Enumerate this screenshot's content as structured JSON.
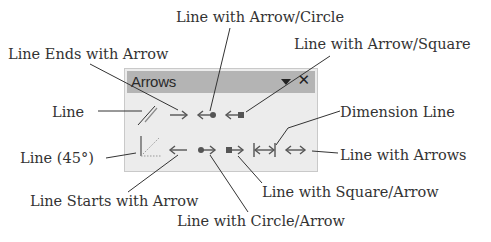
{
  "panel": {
    "title": "Arrows",
    "menu_icon": "dropdown-triangle-icon",
    "close_icon": "close-icon"
  },
  "tools": {
    "row1": [
      {
        "name": "line",
        "label": "Line"
      },
      {
        "name": "line-ends-with-arrow",
        "label": "Line Ends with Arrow"
      },
      {
        "name": "line-with-arrow-circle",
        "label": "Line with Arrow/Circle"
      },
      {
        "name": "line-with-arrow-square",
        "label": "Line with Arrow/Square"
      }
    ],
    "row2": [
      {
        "name": "line-45",
        "label": "Line (45°)"
      },
      {
        "name": "line-starts-with-arrow",
        "label": "Line Starts with Arrow"
      },
      {
        "name": "line-with-circle-arrow",
        "label": "Line with Circle/Arrow"
      },
      {
        "name": "line-with-square-arrow",
        "label": "Line with Square/Arrow"
      },
      {
        "name": "dimension-line",
        "label": "Dimension Line"
      },
      {
        "name": "line-with-arrows",
        "label": "Line with Arrows"
      }
    ]
  },
  "callouts": {
    "line_ends_with_arrow": "Line Ends with Arrow",
    "line_with_arrow_circle": "Line with Arrow/Circle",
    "line_with_arrow_square": "Line with Arrow/Square",
    "line": "Line",
    "dimension_line": "Dimension Line",
    "line_45": "Line (45°)",
    "line_with_arrows": "Line with Arrows",
    "line_starts_with_arrow": "Line Starts with Arrow",
    "line_with_square_arrow": "Line with Square/Arrow",
    "line_with_circle_arrow": "Line with Circle/Arrow"
  }
}
